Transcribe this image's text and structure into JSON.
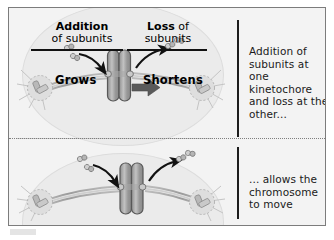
{
  "figure": {
    "frame_color": "#7c7c7c",
    "background_color": "#f3f3f3"
  },
  "headers": {
    "addition_bold": "Addition",
    "addition_rest": "of subunits",
    "loss_bold": "Loss",
    "loss_rest": "of",
    "loss_second_line": "subunits"
  },
  "labels": {
    "grows": "Grows",
    "shortens": "Shortens"
  },
  "captions": {
    "top": "Addition of subunits at one kinetochore and loss at the other...",
    "bottom": "... allows the chromosome to move"
  },
  "icons": {
    "chromosome": "chromosome-icon",
    "kinetochore": "kinetochore-icon",
    "spindle_pole": "spindle-pole-icon",
    "tubulin_dimer": "tubulin-subunit-icon",
    "curved_arrow_in": "curved-arrow-add-icon",
    "curved_arrow_out": "curved-arrow-loss-icon",
    "movement_arrow": "movement-arrow-icon"
  },
  "colors": {
    "cell_fill": "#ebebeb",
    "cell_stroke": "#dcdcdc",
    "chromosome_fill": "#9a9a9a",
    "chromosome_stroke": "#5e5e5e",
    "microtubule": "#a9a9a9",
    "pole_fill": "#d6d6d6",
    "arrow_dark": "#111111",
    "movement_arrow": "#5a5a5a",
    "text": "#1a1a1a",
    "rule": "#1c1c1c"
  },
  "panels": [
    {
      "name": "before",
      "chromosome_x": 103
    },
    {
      "name": "after",
      "chromosome_x": 118
    }
  ]
}
